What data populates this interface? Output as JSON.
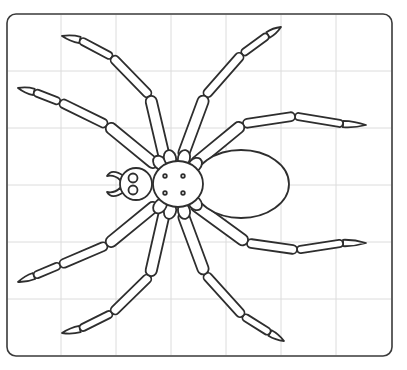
{
  "illustration": {
    "subject": "spider",
    "style": "line-art coloring template on grid",
    "colors": {
      "ink": "#2e2e2e",
      "grid": "#dcdcdc",
      "frame": "#3a3a3a",
      "background": "#ffffff"
    },
    "grid": {
      "columns": 7,
      "rows": 6
    },
    "parts": {
      "legs": 8,
      "eyes": 2,
      "thorax_dots": 4,
      "fangs": 2
    }
  }
}
